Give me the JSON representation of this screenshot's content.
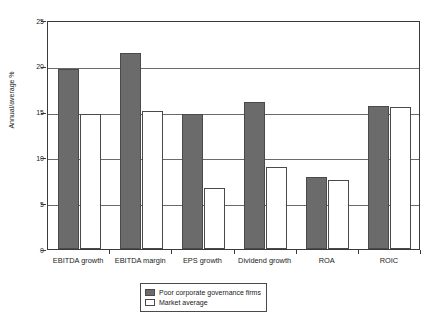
{
  "chart_data": {
    "type": "bar",
    "title": "",
    "subtitle": "",
    "xlabel": "",
    "ylabel": "Annual/average %",
    "ylim": [
      0,
      25
    ],
    "yticks": [
      0,
      5,
      10,
      15,
      20,
      25
    ],
    "ytick_labels": [
      "0",
      "5",
      "10",
      "15",
      "20",
      "25"
    ],
    "grid": true,
    "grid_axis": "y",
    "legend_position": "bottom-center",
    "categories": [
      "EBITDA growth",
      "EBITDA margin",
      "EPS growth",
      "Dividend growth",
      "ROA",
      "ROIC"
    ],
    "series": [
      {
        "name": "Poor corporate governance firms",
        "color": "#6b6b6b",
        "values": [
          19.6,
          21.4,
          14.7,
          16.1,
          7.9,
          15.6
        ]
      },
      {
        "name": "Market average",
        "color": "#ffffff",
        "values": [
          14.7,
          15.1,
          6.7,
          8.9,
          7.5,
          15.5
        ]
      }
    ]
  },
  "legend": {
    "items": [
      {
        "label": "Poor corporate governance firms",
        "swatch": "dark"
      },
      {
        "label": "Market average",
        "swatch": "light"
      }
    ]
  }
}
